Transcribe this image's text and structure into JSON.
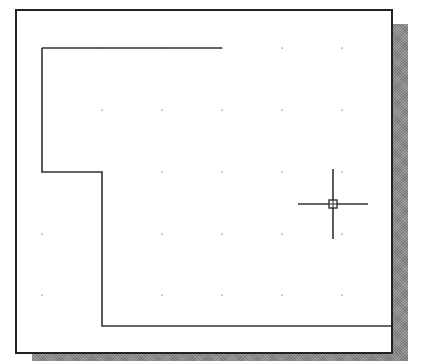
{
  "viewport": {
    "name": "drawing-area",
    "background": "#ffffff",
    "border_color": "#222222",
    "shadow_color": "#8a8a8a"
  },
  "grid": {
    "dot_color": "#777777",
    "x": [
      42,
      102,
      162,
      222,
      282,
      342
    ],
    "y": [
      48,
      110,
      172,
      234,
      295
    ]
  },
  "geometry": {
    "line_color": "#333333",
    "polylines": [
      {
        "name": "top-edge-line",
        "points": "42,48 222,48"
      },
      {
        "name": "outline-polyline",
        "points": "42,48 42,172 102,172 102,326 391,326"
      }
    ]
  },
  "cursor": {
    "name": "crosshair-cursor",
    "x": 333,
    "y": 204,
    "half_width": 35,
    "half_height": 35,
    "pickbox_size": 8,
    "color": "#333333"
  }
}
